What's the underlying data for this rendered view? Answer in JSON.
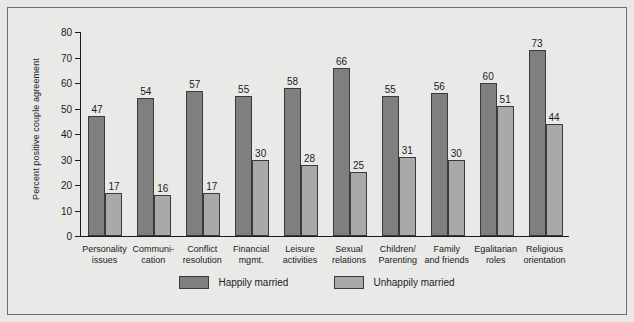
{
  "chart_data": {
    "type": "bar",
    "title": "",
    "xlabel": "",
    "ylabel": "Percent positive couple agreement",
    "ylim": [
      0,
      80
    ],
    "yticks": [
      0,
      10,
      20,
      30,
      40,
      50,
      60,
      70,
      80
    ],
    "grid": false,
    "legend_position": "bottom-center",
    "categories": [
      "Personality\nissues",
      "Communi-\ncation",
      "Conflict\nresolution",
      "Financial\nmgmt.",
      "Leisure\nactivities",
      "Sexual\nrelations",
      "Children/\nParenting",
      "Family\nand friends",
      "Egalitarian\nroles",
      "Religious\norientation"
    ],
    "series": [
      {
        "name": "Happily married",
        "color": "#7f7f7f",
        "values": [
          47,
          54,
          57,
          55,
          58,
          66,
          55,
          56,
          60,
          73
        ]
      },
      {
        "name": "Unhappily married",
        "color": "#a9a9a9",
        "values": [
          17,
          16,
          17,
          30,
          28,
          25,
          31,
          30,
          51,
          44
        ]
      }
    ]
  },
  "legend": {
    "items": [
      {
        "label": "Happily married",
        "swatch": "happy"
      },
      {
        "label": "Unhappily married",
        "swatch": "unhappy"
      }
    ]
  }
}
